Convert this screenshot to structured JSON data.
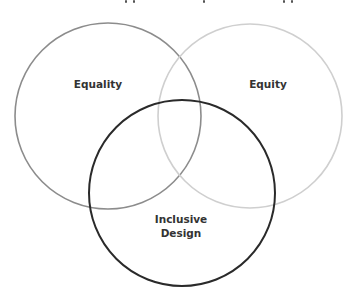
{
  "diagram": {
    "type": "venn",
    "circles": [
      {
        "id": "equality",
        "label": "Equality",
        "cx": 108,
        "cy": 116,
        "r": 93,
        "stroke": "#8c8c8c",
        "stroke_width": 1.6,
        "label_x": 98,
        "label_y": 84
      },
      {
        "id": "equity",
        "label": "Equity",
        "cx": 250,
        "cy": 116,
        "r": 92,
        "stroke": "#cfcfcf",
        "stroke_width": 1.6,
        "label_x": 268,
        "label_y": 84
      },
      {
        "id": "inclusive-design",
        "label_lines": [
          "Inclusive",
          "Design"
        ],
        "cx": 182,
        "cy": 193,
        "r": 93,
        "stroke": "#2a2a2a",
        "stroke_width": 2,
        "label_x": 181,
        "label_y": 226
      }
    ]
  }
}
